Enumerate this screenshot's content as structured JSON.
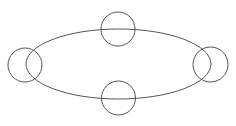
{
  "canvas": {
    "width": 236,
    "height": 126,
    "background": "#ffffff"
  },
  "stroke_color": "#555555",
  "ellipse": {
    "cx": 118.5,
    "cy": 64,
    "rx": 92.5,
    "ry": 35
  },
  "circles": [
    {
      "name": "top",
      "cx": 118,
      "cy": 29,
      "r": 17
    },
    {
      "name": "bottom",
      "cx": 118.5,
      "cy": 98,
      "r": 17
    },
    {
      "name": "left",
      "cx": 25,
      "cy": 65,
      "r": 17
    },
    {
      "name": "right",
      "cx": 210.5,
      "cy": 64.5,
      "r": 17.5
    }
  ]
}
